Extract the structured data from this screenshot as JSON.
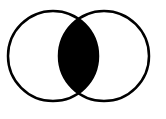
{
  "diagram": {
    "type": "venn",
    "shaded_region": "intersection",
    "colors": {
      "background": "#ffffff",
      "stroke": "#000000",
      "fill_intersection": "#000000"
    },
    "sets": [
      {
        "name": "left-circle",
        "cx": 53,
        "cy": 56,
        "r": 45
      },
      {
        "name": "right-circle",
        "cx": 104,
        "cy": 56,
        "r": 45
      }
    ]
  }
}
